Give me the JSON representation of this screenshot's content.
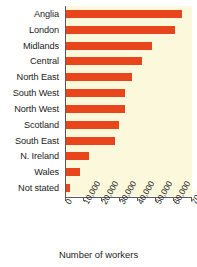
{
  "chart_data": {
    "type": "bar",
    "orientation": "horizontal",
    "title": "",
    "xlabel": "Number of workers",
    "ylabel": "",
    "categories": [
      "Anglia",
      "London",
      "Midlands",
      "Central",
      "North East",
      "South West",
      "North West",
      "Scotland",
      "South East",
      "N. Ireland",
      "Wales",
      "Not stated"
    ],
    "values": [
      64500,
      60500,
      48000,
      42000,
      36500,
      33000,
      32500,
      29500,
      27000,
      12500,
      7500,
      2000
    ],
    "xlim": [
      0,
      70000
    ],
    "xticks": [
      0,
      10000,
      20000,
      30000,
      40000,
      50000,
      60000,
      70000
    ],
    "xtick_labels": [
      "0",
      "10,000",
      "20,000",
      "30,000",
      "40,000",
      "50,000",
      "60,000",
      "70,000"
    ],
    "grid": false,
    "legend": false,
    "bar_color": "#e8451c",
    "plot_background": "#fbf8dc",
    "axis_color": "#5a5a58"
  }
}
